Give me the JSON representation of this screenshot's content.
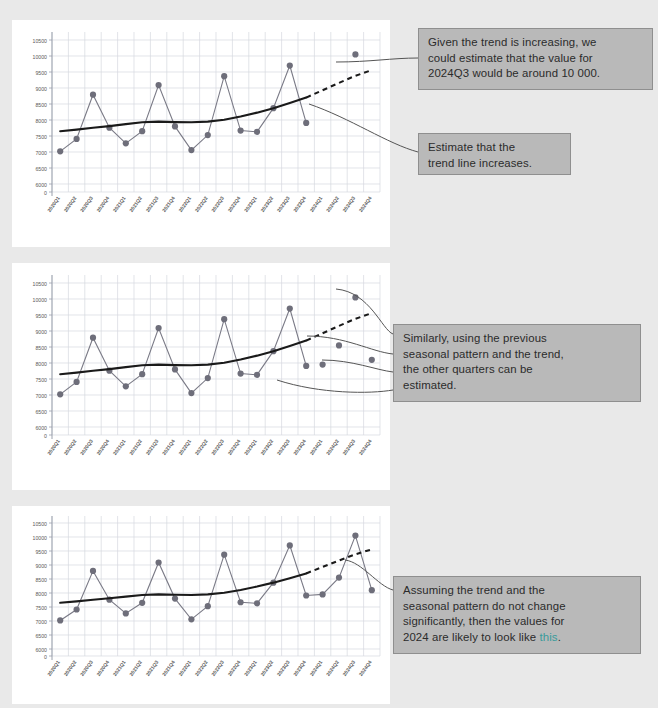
{
  "page": {
    "background_color": "#e9e9e9",
    "card_color": "#ffffff",
    "callout_fill": "#b9b9b9",
    "callout_border": "#8f8f8f",
    "highlight_color": "#3a9b9b",
    "series_color": "#7a7a86",
    "marker_color": "#6e6e7a",
    "trend_color": "#1a1a1a",
    "gridline_color": "#d5d8e0",
    "axis_text_color": "#595959"
  },
  "annotations": [
    {
      "id": "annotation-1",
      "lines": [
        "Given the trend is increasing, we",
        "could estimate that the value for",
        "2024Q3 would be around 10 000."
      ]
    },
    {
      "id": "annotation-2",
      "lines": [
        "Estimate that the",
        "trend line increases."
      ]
    },
    {
      "id": "annotation-3",
      "lines": [
        "Similarly, using the previous",
        "seasonal pattern and the trend,",
        "the other quarters can be",
        "estimated."
      ]
    },
    {
      "id": "annotation-4",
      "lines": [
        "Assuming the trend and the",
        "seasonal pattern do not change",
        "significantly, then the values for",
        "2024 are likely to look like "
      ],
      "highlight_word": "this",
      "trailing": "."
    }
  ],
  "chart_data": [
    {
      "id": "chart-1",
      "type": "line",
      "title": "",
      "xlabel": "",
      "ylabel": "",
      "grid": true,
      "legend": "none",
      "ylim": [
        5750,
        10750
      ],
      "ytick_labels": [
        "0",
        "6000",
        "6500",
        "7000",
        "7500",
        "8000",
        "8500",
        "9000",
        "9500",
        "10000",
        "10500"
      ],
      "yticks": [
        5750,
        6000,
        6500,
        7000,
        7500,
        8000,
        8500,
        9000,
        9500,
        10000,
        10500
      ],
      "categories": [
        "2020Q1",
        "2020Q2",
        "2020Q3",
        "2020Q4",
        "2021Q1",
        "2021Q2",
        "2021Q3",
        "2021Q4",
        "2022Q1",
        "2022Q2",
        "2022Q3",
        "2022Q4",
        "2023Q1",
        "2023Q2",
        "2023Q3",
        "2023Q4",
        "2024Q1",
        "2024Q2",
        "2024Q3",
        "2024Q4"
      ],
      "series": [
        {
          "name": "Actual",
          "style": "line-markers",
          "values": [
            7020,
            7410,
            8790,
            7760,
            7270,
            7650,
            9090,
            7800,
            7060,
            7530,
            9370,
            7670,
            7630,
            8370,
            9700,
            7910,
            null,
            null,
            null,
            null
          ]
        },
        {
          "name": "Trend",
          "style": "solid-thick",
          "values": [
            7650,
            7700,
            7760,
            7810,
            7870,
            7930,
            7950,
            7935,
            7930,
            7950,
            8010,
            8110,
            8230,
            8370,
            8530,
            8700,
            null,
            null,
            null,
            null
          ]
        },
        {
          "name": "Trend (projected)",
          "style": "dashed-thick",
          "values": [
            null,
            null,
            null,
            null,
            null,
            null,
            null,
            null,
            null,
            null,
            null,
            null,
            null,
            null,
            null,
            8700,
            8930,
            9160,
            9380,
            9560
          ]
        },
        {
          "name": "Estimate",
          "style": "markers-only",
          "values": [
            null,
            null,
            null,
            null,
            null,
            null,
            null,
            null,
            null,
            null,
            null,
            null,
            null,
            null,
            null,
            null,
            null,
            null,
            10050,
            null
          ]
        }
      ]
    },
    {
      "id": "chart-2",
      "type": "line",
      "title": "",
      "xlabel": "",
      "ylabel": "",
      "grid": true,
      "legend": "none",
      "ylim": [
        5750,
        10750
      ],
      "ytick_labels": [
        "0",
        "6000",
        "6500",
        "7000",
        "7500",
        "8000",
        "8500",
        "9000",
        "9500",
        "10000",
        "10500"
      ],
      "yticks": [
        5750,
        6000,
        6500,
        7000,
        7500,
        8000,
        8500,
        9000,
        9500,
        10000,
        10500
      ],
      "categories": [
        "2020Q1",
        "2020Q2",
        "2020Q3",
        "2020Q4",
        "2021Q1",
        "2021Q2",
        "2021Q3",
        "2021Q4",
        "2022Q1",
        "2022Q2",
        "2022Q3",
        "2022Q4",
        "2023Q1",
        "2023Q2",
        "2023Q3",
        "2023Q4",
        "2024Q1",
        "2024Q2",
        "2024Q3",
        "2024Q4"
      ],
      "series": [
        {
          "name": "Actual",
          "style": "line-markers",
          "values": [
            7020,
            7410,
            8790,
            7760,
            7270,
            7650,
            9090,
            7800,
            7060,
            7530,
            9370,
            7670,
            7630,
            8370,
            9700,
            7910,
            null,
            null,
            null,
            null
          ]
        },
        {
          "name": "Trend",
          "style": "solid-thick",
          "values": [
            7650,
            7700,
            7760,
            7810,
            7870,
            7930,
            7950,
            7935,
            7930,
            7950,
            8010,
            8110,
            8230,
            8370,
            8530,
            8700,
            null,
            null,
            null,
            null
          ]
        },
        {
          "name": "Trend (projected)",
          "style": "dashed-thick",
          "values": [
            null,
            null,
            null,
            null,
            null,
            null,
            null,
            null,
            null,
            null,
            null,
            null,
            null,
            null,
            null,
            8700,
            8930,
            9160,
            9380,
            9560
          ]
        },
        {
          "name": "Estimate",
          "style": "markers-only",
          "values": [
            null,
            null,
            null,
            null,
            null,
            null,
            null,
            null,
            null,
            null,
            null,
            null,
            null,
            null,
            null,
            null,
            7950,
            8550,
            10050,
            8100
          ]
        }
      ]
    },
    {
      "id": "chart-3",
      "type": "line",
      "title": "",
      "xlabel": "",
      "ylabel": "",
      "grid": true,
      "legend": "none",
      "ylim": [
        5750,
        10750
      ],
      "ytick_labels": [
        "0",
        "6000",
        "6500",
        "7000",
        "7500",
        "8000",
        "8500",
        "9000",
        "9500",
        "10000",
        "10500"
      ],
      "yticks": [
        5750,
        6000,
        6500,
        7000,
        7500,
        8000,
        8500,
        9000,
        9500,
        10000,
        10500
      ],
      "categories": [
        "2020Q1",
        "2020Q2",
        "2020Q3",
        "2020Q4",
        "2021Q1",
        "2021Q2",
        "2021Q3",
        "2021Q4",
        "2022Q1",
        "2022Q2",
        "2022Q3",
        "2022Q4",
        "2023Q1",
        "2023Q2",
        "2023Q3",
        "2023Q4",
        "2024Q1",
        "2024Q2",
        "2024Q3",
        "2024Q4"
      ],
      "series": [
        {
          "name": "Actual + Estimate",
          "style": "line-markers",
          "values": [
            7020,
            7410,
            8790,
            7760,
            7270,
            7650,
            9090,
            7800,
            7060,
            7530,
            9370,
            7670,
            7630,
            8370,
            9700,
            7910,
            7950,
            8550,
            10050,
            8100
          ]
        },
        {
          "name": "Trend",
          "style": "solid-thick",
          "values": [
            7650,
            7700,
            7760,
            7810,
            7870,
            7930,
            7950,
            7935,
            7930,
            7950,
            8010,
            8110,
            8230,
            8370,
            8530,
            8700,
            null,
            null,
            null,
            null
          ]
        },
        {
          "name": "Trend (projected)",
          "style": "dashed-thick",
          "values": [
            null,
            null,
            null,
            null,
            null,
            null,
            null,
            null,
            null,
            null,
            null,
            null,
            null,
            null,
            null,
            8700,
            8930,
            9160,
            9380,
            9560
          ]
        }
      ]
    }
  ]
}
